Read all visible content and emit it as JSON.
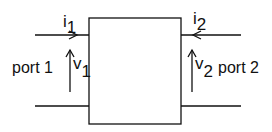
{
  "diagram": {
    "port1": {
      "label": "port 1",
      "current": "i",
      "current_sub": "1",
      "voltage": "v",
      "voltage_sub": "1"
    },
    "port2": {
      "label": "port 2",
      "current": "i",
      "current_sub": "2",
      "voltage": "v",
      "voltage_sub": "2"
    },
    "colors": {
      "stroke": "#111111",
      "background": "#ffffff"
    }
  }
}
